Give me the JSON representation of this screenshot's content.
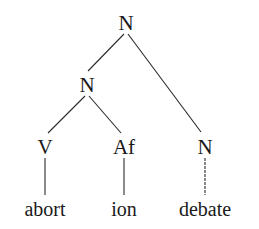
{
  "diagram": {
    "type": "morphological-tree",
    "root": {
      "label": "N",
      "children": [
        {
          "label": "N",
          "children": [
            {
              "label": "V",
              "children": [
                {
                  "word": "abort"
                }
              ]
            },
            {
              "label": "Af",
              "children": [
                {
                  "word": "ion"
                }
              ]
            }
          ]
        },
        {
          "label": "N",
          "children": [
            {
              "word": "debate"
            }
          ]
        }
      ]
    },
    "nodes": {
      "root": "N",
      "compound_left": "N",
      "verb": "V",
      "affix": "Af",
      "noun_right": "N"
    },
    "leaves": {
      "abort": "abort",
      "ion": "ion",
      "debate": "debate"
    }
  }
}
